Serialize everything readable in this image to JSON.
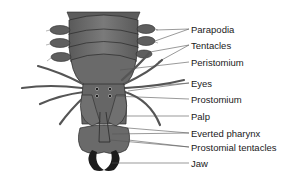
{
  "diagram": {
    "colors": {
      "body": "#6b6b6b",
      "body_dark": "#4a4a4a",
      "body_light": "#858585",
      "outline": "#2a2a2a",
      "jaw": "#1c1c1c",
      "leader": "#555555",
      "text": "#1a1a1a"
    },
    "labels": [
      {
        "id": "parapodia",
        "text": "Parapodia",
        "x": 191,
        "y": 24
      },
      {
        "id": "tentacles",
        "text": "Tentacles",
        "x": 191,
        "y": 40
      },
      {
        "id": "peristomium",
        "text": "Peristomium",
        "x": 191,
        "y": 57
      },
      {
        "id": "eyes",
        "text": "Eyes",
        "x": 191,
        "y": 78
      },
      {
        "id": "prostomium",
        "text": "Prostomium",
        "x": 191,
        "y": 94
      },
      {
        "id": "palp",
        "text": "Palp",
        "x": 191,
        "y": 111
      },
      {
        "id": "everted-pharynx",
        "text": "Everted pharynx",
        "x": 191,
        "y": 128
      },
      {
        "id": "prostomial-tentacles",
        "text": "Prostomial tentacles",
        "x": 191,
        "y": 142
      },
      {
        "id": "jaw",
        "text": "Jaw",
        "x": 191,
        "y": 158
      }
    ]
  }
}
